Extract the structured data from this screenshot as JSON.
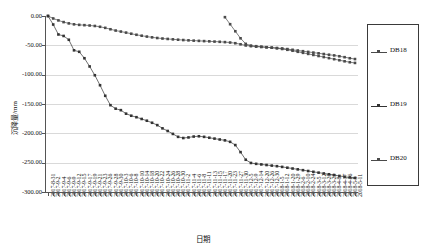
{
  "chart_data": {
    "type": "line",
    "title": "",
    "xlabel": "日期",
    "ylabel": "沉降量/mm",
    "ylim": [
      -300,
      0
    ],
    "yticks": [
      "0.00",
      "-50.00",
      "-100.00",
      "-150.00",
      "-200.00",
      "-250.00",
      "-300.00"
    ],
    "ytick_values": [
      0,
      -50,
      -100,
      -150,
      -200,
      -250,
      -300
    ],
    "grid": true,
    "legend_position": "right",
    "legend": [
      "DB18",
      "DB19",
      "DB20"
    ],
    "categories": [
      "2017-8-31",
      "2017-9-2",
      "2017-9-4",
      "2017-9-6",
      "2017-9-9",
      "2017-9-12",
      "2017-9-15",
      "2017-9-17",
      "2017-9-19",
      "2017-9-21",
      "2017-9-23",
      "2017-9-26",
      "2017-9-28",
      "2017-9-30",
      "2017-10-3",
      "2017-10-6",
      "2017-10-8",
      "2017-10-10",
      "2017-10-14",
      "2017-10-18",
      "2017-10-20",
      "2017-10-22",
      "2017-10-24",
      "2017-10-26",
      "2017-10-28",
      "2017-10-30",
      "2017-11-2",
      "2017-11-4",
      "2017-11-6",
      "2017-11-8",
      "2017-11-11",
      "2017-11-13",
      "2017-11-15",
      "2017-11-17",
      "2017-11-20",
      "2017-11-23",
      "2017-11-27",
      "2017-11-30",
      "2017-12-5",
      "2017-12-9",
      "2017-12-14",
      "2017-12-20",
      "2017-12-26",
      "2017-12-30",
      "2018-1-5",
      "2018-1-12",
      "2018-1-20",
      "2018-1-29",
      "2018-2-6",
      "2018-2-10",
      "2018-2-24",
      "2018-3-5",
      "2018-3-12",
      "2018-3-20",
      "2018-3-29",
      "2018-4-8",
      "2018-4-17",
      "2018-4-26",
      "2018-5-5",
      "2018-5-11"
    ],
    "series": [
      {
        "name": "DB18",
        "color": "#4a4a4a",
        "values": [
          0.0,
          -4.2,
          -7.5,
          -10.4,
          -12.6,
          -14.2,
          -15.1,
          -15.6,
          -16.2,
          -17.0,
          -18.4,
          -20.2,
          -22.6,
          -24.8,
          -26.5,
          -28.3,
          -30.2,
          -32.0,
          -33.6,
          -35.1,
          -36.4,
          -37.5,
          -38.4,
          -39.1,
          -39.8,
          -40.4,
          -41.0,
          -41.5,
          -42.0,
          -42.4,
          -42.8,
          -43.2,
          -43.6,
          -44.0,
          -44.5,
          -45.2,
          -46.4,
          -48.2,
          -50.2,
          -51.4,
          -52.2,
          -52.8,
          -53.4,
          -54.0,
          -54.6,
          -55.4,
          -56.4,
          -57.6,
          -58.8,
          -60.0,
          -61.2,
          -62.4,
          -63.6,
          -64.8,
          -66.0,
          -67.2,
          -68.6,
          -70.2,
          -72.0,
          -73.4
        ]
      },
      {
        "name": "DB19",
        "color": "#333333",
        "values": [
          0.0,
          -14.5,
          -31.5,
          -34.0,
          -40.5,
          -58.5,
          -61.0,
          -72.0,
          -86.0,
          -101.0,
          -118.0,
          -136.0,
          -152.0,
          -158.0,
          -160.5,
          -166.5,
          -170.0,
          -172.5,
          -175.5,
          -178.5,
          -182.0,
          -186.0,
          -191.5,
          -196.0,
          -201.0,
          -206.0,
          -208.0,
          -207.0,
          -205.5,
          -205.0,
          -206.0,
          -207.5,
          -209.0,
          -210.5,
          -212.0,
          -214.5,
          -220.0,
          -232.0,
          -245.0,
          -250.5,
          -252.0,
          -253.0,
          -254.0,
          -255.0,
          -256.0,
          -257.2,
          -258.6,
          -260.0,
          -261.4,
          -262.8,
          -264.2,
          -265.6,
          -267.0,
          -268.4,
          -269.8,
          -271.2,
          -272.6,
          -274.0,
          -275.2,
          -276.0
        ]
      },
      {
        "name": "DB20",
        "color": "#4a4a4a",
        "values": [
          null,
          null,
          null,
          null,
          null,
          null,
          null,
          null,
          null,
          null,
          null,
          null,
          null,
          null,
          null,
          null,
          null,
          null,
          null,
          null,
          null,
          null,
          null,
          null,
          null,
          null,
          null,
          null,
          null,
          null,
          null,
          null,
          null,
          null,
          -2.0,
          -14.0,
          -26.0,
          -38.0,
          -47.5,
          -50.5,
          -51.5,
          -52.4,
          -53.2,
          -54.0,
          -55.0,
          -56.2,
          -57.6,
          -59.2,
          -61.0,
          -62.8,
          -64.6,
          -66.4,
          -68.2,
          -70.0,
          -71.8,
          -73.6,
          -75.4,
          -77.2,
          -78.8,
          -80.0
        ]
      }
    ]
  }
}
